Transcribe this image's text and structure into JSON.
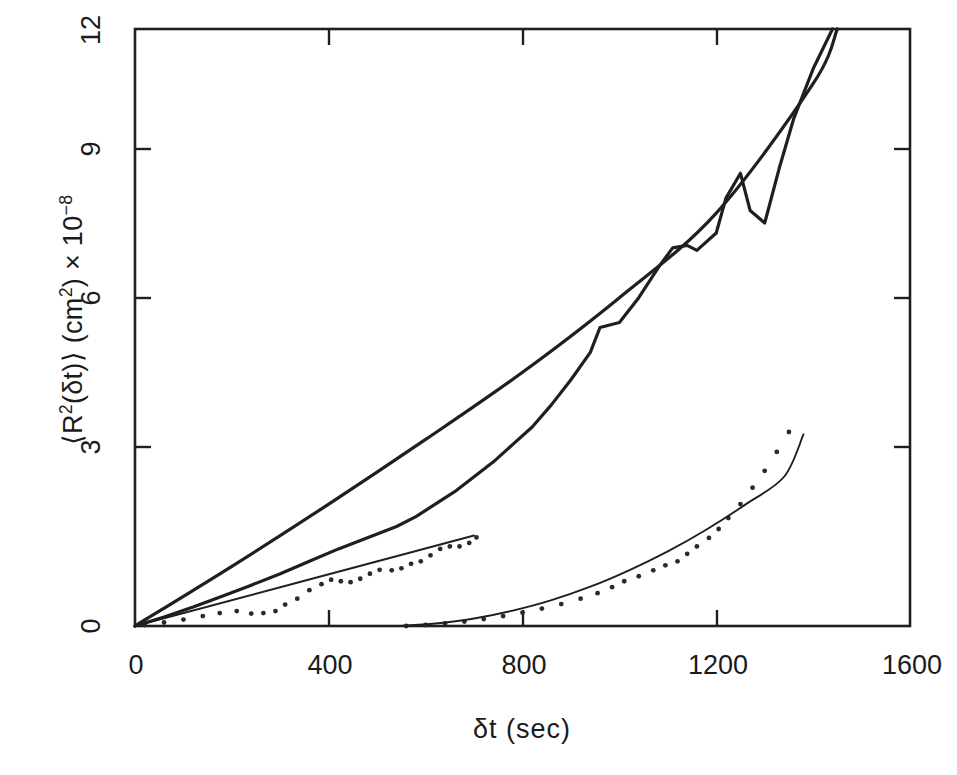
{
  "figure": {
    "kind": "scientific-plot",
    "background": "#ffffff",
    "ink_color": "#1f1f1f"
  },
  "axes": {
    "x_title": "δt  (sec)",
    "y_title_html": "⟨R<sup>2</sup>(δt)⟩  (cm<sup>2</sup>)  ×  10<sup>−8</sup>",
    "x_ticks": [
      "0",
      "400",
      "800",
      "1200",
      "1600"
    ],
    "y_ticks": [
      "0",
      "3",
      "6",
      "9",
      "12"
    ],
    "x_range": [
      0,
      1600
    ],
    "y_range": [
      0,
      12
    ],
    "grid": false
  },
  "chart_data": {
    "type": "line",
    "title": "",
    "xlabel": "δt (sec)",
    "ylabel": "⟨R²(δt)⟩ (cm²) × 10⁻⁸",
    "xlim": [
      0,
      1600
    ],
    "ylim": [
      0,
      12
    ],
    "xticks": [
      0,
      400,
      800,
      1200,
      1600
    ],
    "yticks": [
      0,
      3,
      6,
      9,
      12
    ],
    "grid": false,
    "legend": "none",
    "series": [
      {
        "name": "upper-experimental-jagged",
        "style": "solid-line-thick",
        "x": [
          0,
          60,
          120,
          180,
          240,
          300,
          360,
          420,
          460,
          500,
          540,
          580,
          620,
          660,
          700,
          740,
          780,
          820,
          860,
          900,
          940,
          960,
          1000,
          1040,
          1080,
          1110,
          1140,
          1160,
          1200,
          1220,
          1250,
          1270,
          1300,
          1330,
          1360,
          1400,
          1440
        ],
        "y": [
          0.0,
          0.18,
          0.38,
          0.6,
          0.82,
          1.05,
          1.3,
          1.55,
          1.7,
          1.85,
          2.0,
          2.2,
          2.45,
          2.7,
          3.0,
          3.3,
          3.65,
          4.0,
          4.45,
          4.95,
          5.5,
          6.0,
          6.1,
          6.6,
          7.2,
          7.6,
          7.65,
          7.55,
          7.9,
          8.6,
          9.1,
          8.35,
          8.1,
          9.2,
          10.2,
          11.2,
          12.0
        ]
      },
      {
        "name": "upper-linear-fit",
        "style": "solid-line-thick",
        "x": [
          0,
          200,
          400,
          600,
          800,
          1000,
          1200,
          1400,
          1450
        ],
        "y": [
          0.0,
          1.2,
          2.45,
          3.75,
          5.1,
          6.6,
          8.3,
          10.9,
          12.0
        ]
      },
      {
        "name": "middle-dotted-data",
        "style": "dotted-markers",
        "x": [
          20,
          60,
          100,
          140,
          175,
          210,
          240,
          265,
          290,
          310,
          335,
          360,
          385,
          405,
          425,
          445,
          465,
          485,
          505,
          530,
          550,
          570,
          590,
          610,
          630,
          650,
          670,
          690,
          705
        ],
        "y": [
          0.02,
          0.07,
          0.13,
          0.2,
          0.26,
          0.3,
          0.25,
          0.26,
          0.3,
          0.43,
          0.55,
          0.72,
          0.84,
          0.93,
          0.9,
          0.88,
          0.95,
          1.05,
          1.13,
          1.12,
          1.16,
          1.25,
          1.3,
          1.42,
          1.55,
          1.6,
          1.6,
          1.67,
          1.78
        ]
      },
      {
        "name": "middle-linear-fit",
        "style": "solid-line-thin",
        "x": [
          0,
          700
        ],
        "y": [
          0.0,
          1.82
        ]
      },
      {
        "name": "lower-dotted-ballistic-data",
        "style": "dotted-markers",
        "x": [
          560,
          600,
          640,
          680,
          720,
          760,
          800,
          840,
          880,
          920,
          955,
          985,
          1010,
          1040,
          1070,
          1095,
          1120,
          1140,
          1160,
          1185,
          1205,
          1225,
          1250,
          1275,
          1300,
          1325,
          1350
        ],
        "y": [
          0.0,
          0.02,
          0.05,
          0.09,
          0.14,
          0.2,
          0.27,
          0.35,
          0.44,
          0.55,
          0.66,
          0.78,
          0.9,
          1.0,
          1.12,
          1.22,
          1.3,
          1.45,
          1.6,
          1.77,
          1.95,
          2.17,
          2.45,
          2.78,
          3.12,
          3.5,
          3.9
        ]
      },
      {
        "name": "lower-quadratic-fit",
        "style": "solid-line-thin",
        "x": [
          540,
          620,
          700,
          780,
          860,
          940,
          1020,
          1100,
          1180,
          1260,
          1340,
          1380
        ],
        "y": [
          0.0,
          0.05,
          0.15,
          0.31,
          0.52,
          0.79,
          1.12,
          1.5,
          1.94,
          2.44,
          3.0,
          3.85
        ]
      }
    ]
  }
}
